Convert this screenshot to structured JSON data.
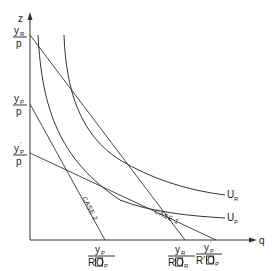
{
  "diagram": {
    "axes": {
      "x_label": "q",
      "y_label": "z"
    },
    "y_intercepts": [
      {
        "id": "yR_over_p",
        "num": "y",
        "num_sub": "R",
        "den": "p"
      },
      {
        "id": "yP_over_p",
        "num": "y",
        "num_sub": "P",
        "den": "p"
      },
      {
        "id": "yPprime_over_p",
        "num": "y",
        "num_sub": "P",
        "num_prime": "′",
        "den": "p"
      }
    ],
    "x_intercepts": [
      {
        "id": "yP_over_ROP",
        "num": "y",
        "num_sub": "P",
        "den": "R",
        "den_box": "O",
        "den_sub": "P"
      },
      {
        "id": "yR_over_ROR",
        "num": "y",
        "num_sub": "R",
        "den": "R",
        "den_box": "O",
        "den_sub": "R"
      },
      {
        "id": "yPprime_over_RprimeOP",
        "num": "y",
        "num_sub": "P",
        "num_prime": "′",
        "den": "R′",
        "den_box": "O",
        "den_sub": "P"
      }
    ],
    "curves": [
      {
        "id": "UR",
        "label": "U",
        "label_sub": "R"
      },
      {
        "id": "UP",
        "label": "U",
        "label_sub": "P"
      }
    ],
    "case_labels": {
      "case1": "CASE 1",
      "case2": "CASE 2"
    }
  }
}
